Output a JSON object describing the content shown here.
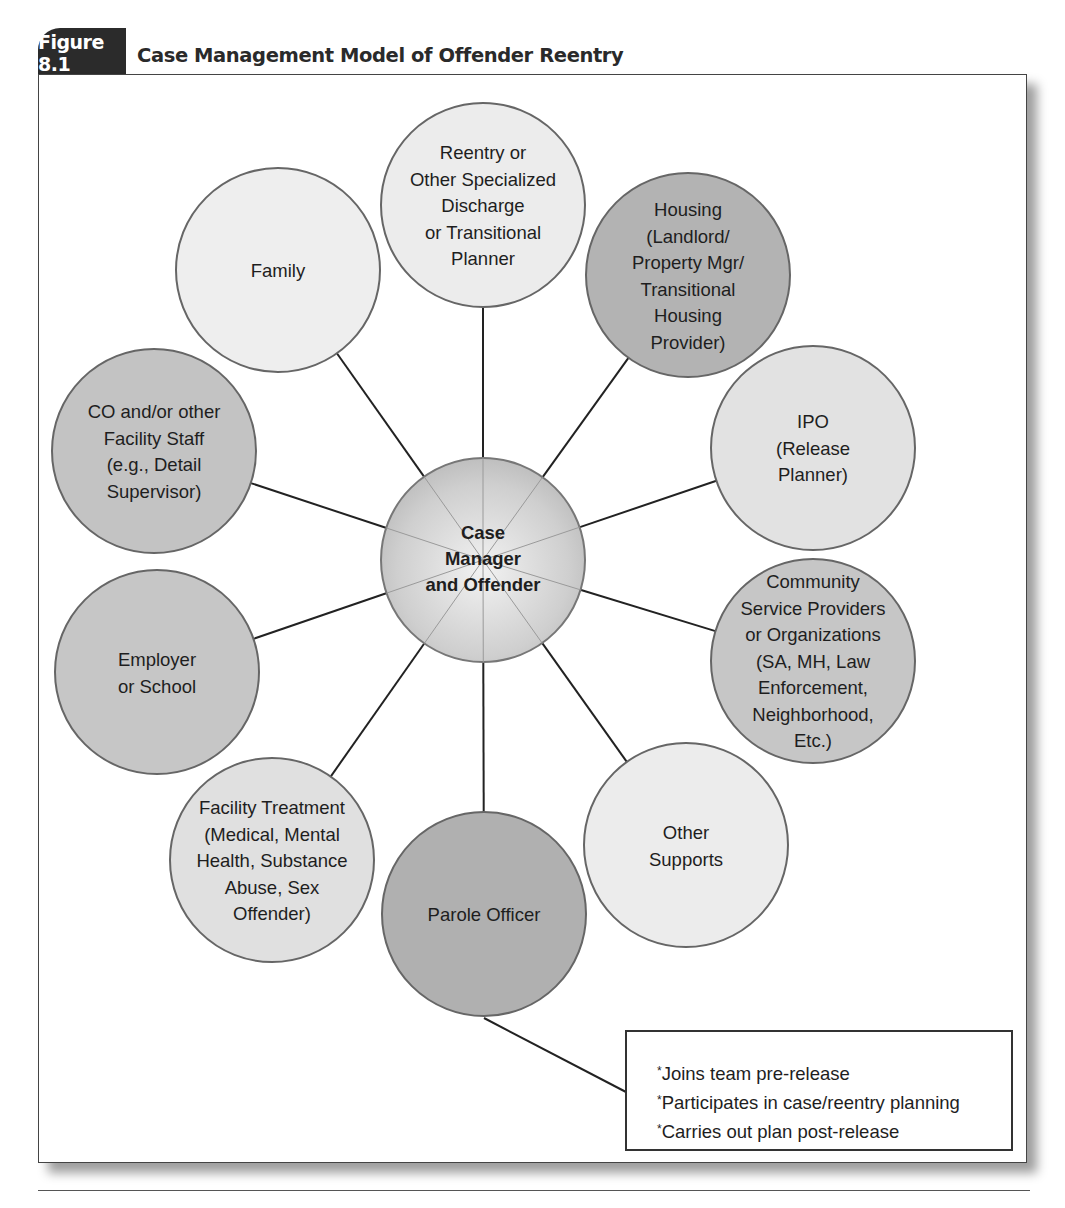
{
  "figure": {
    "number": "Figure 8.1",
    "title": "Case Management Model of Offender Reentry"
  },
  "center": {
    "label_lines": [
      "Case",
      "Manager",
      "and Offender"
    ],
    "cx": 483,
    "cy": 560,
    "r": 102
  },
  "nodes": [
    {
      "id": "reentry-planner",
      "lines": [
        "Reentry or",
        "Other Specialized",
        "Discharge",
        "or Transitional",
        "Planner"
      ],
      "cx": 483,
      "cy": 205,
      "fill": "#ececec"
    },
    {
      "id": "housing",
      "lines": [
        "Housing",
        "(Landlord/",
        "Property Mgr/",
        "Transitional",
        "Housing",
        "Provider)"
      ],
      "cx": 688,
      "cy": 275,
      "fill": "#b3b3b3"
    },
    {
      "id": "ipo",
      "lines": [
        "IPO",
        "(Release",
        "Planner)"
      ],
      "cx": 813,
      "cy": 448,
      "fill": "#e2e2e2"
    },
    {
      "id": "community-service",
      "lines": [
        "Community",
        "Service Providers",
        "or Organizations",
        "(SA, MH, Law",
        "Enforcement,",
        "Neighborhood,",
        "Etc.)"
      ],
      "cx": 813,
      "cy": 661,
      "fill": "#c6c6c6"
    },
    {
      "id": "other-supports",
      "lines": [
        "Other",
        "Supports"
      ],
      "cx": 686,
      "cy": 845,
      "fill": "#ececec"
    },
    {
      "id": "parole-officer",
      "lines": [
        "Parole Officer"
      ],
      "cx": 484,
      "cy": 914,
      "fill": "#b0b0b0"
    },
    {
      "id": "facility-treatment",
      "lines": [
        "Facility Treatment",
        "(Medical, Mental",
        "Health, Substance",
        "Abuse, Sex",
        "Offender)"
      ],
      "cx": 272,
      "cy": 860,
      "fill": "#e0e0e0"
    },
    {
      "id": "employer-school",
      "lines": [
        "Employer",
        "or School"
      ],
      "cx": 157,
      "cy": 672,
      "fill": "#c6c6c6"
    },
    {
      "id": "facility-staff",
      "lines": [
        "CO and/or other",
        "Facility Staff",
        "(e.g., Detail",
        "Supervisor)"
      ],
      "cx": 154,
      "cy": 451,
      "fill": "#c3c3c3"
    },
    {
      "id": "family",
      "lines": [
        "Family"
      ],
      "cx": 278,
      "cy": 270,
      "fill": "#eeeeee"
    }
  ],
  "node_radius": 102,
  "parole_note": {
    "items": [
      "Joins team pre-release",
      "Participates in case/reentry planning",
      "Carries out plan post-release"
    ],
    "bullet": "*"
  },
  "colors": {
    "tab_bg": "#2b2b2b",
    "stroke": "#666666",
    "connector": "#222222"
  }
}
